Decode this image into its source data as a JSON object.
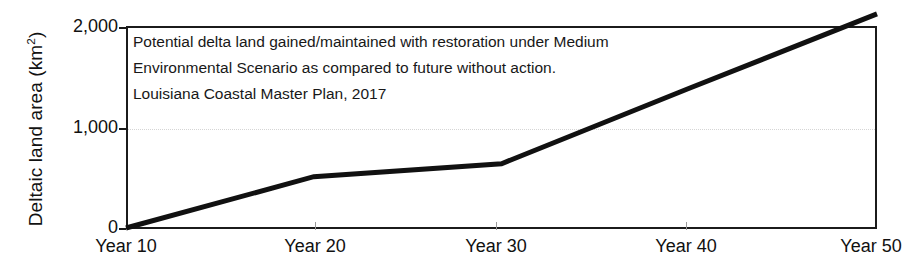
{
  "chart_data": {
    "type": "line",
    "title": "",
    "xlabel": "",
    "ylabel": "Deltaic land area (km²)",
    "ylabel_base": "Deltaic land area (km",
    "ylabel_sup": "2",
    "ylabel_close": ")",
    "categories": [
      "Year 10",
      "Year 20",
      "Year 30",
      "Year 40",
      "Year 50"
    ],
    "x": [
      10,
      20,
      30,
      40,
      50
    ],
    "values": [
      0,
      510,
      640,
      1390,
      2130
    ],
    "series": [
      {
        "name": "Potential delta land gained/maintained with restoration",
        "values": [
          0,
          510,
          640,
          1390,
          2130
        ],
        "color": "#111111",
        "line_width": 5
      }
    ],
    "xlim": [
      10,
      50
    ],
    "ylim": [
      0,
      2000
    ],
    "ytick_values": [
      0,
      1000,
      2000
    ],
    "ytick_labels": [
      "0",
      "1,000",
      "2,000"
    ],
    "grid": "horizontal-1000-only",
    "grid_color": "#d5d5d5",
    "legend": "none",
    "axis_color": "#1b1b1b",
    "plot_background": "#ffffff",
    "annotations": [
      "Potential delta land gained/maintained with restoration under Medium",
      "Environmental Scenario as compared to future without action.",
      "Louisiana Coastal Master Plan, 2017"
    ],
    "note_source": "Louisiana Coastal Master Plan, 2017",
    "note_scenario": "Medium Environmental Scenario"
  },
  "axes": {
    "y_ticks": [
      {
        "label": "2,000",
        "value": 2000
      },
      {
        "label": "1,000",
        "value": 1000
      },
      {
        "label": "0",
        "value": 0
      }
    ],
    "x_ticks": [
      {
        "label": "Year 10",
        "value": 10
      },
      {
        "label": "Year 20",
        "value": 20
      },
      {
        "label": "Year 30",
        "value": 30
      },
      {
        "label": "Year 40",
        "value": 40
      },
      {
        "label": "Year 50",
        "value": 50
      }
    ]
  },
  "annotation": {
    "line1": "Potential delta land gained/maintained with restoration under Medium",
    "line2": "Environmental Scenario as compared to future without action.",
    "line3": "Louisiana Coastal Master Plan, 2017"
  }
}
